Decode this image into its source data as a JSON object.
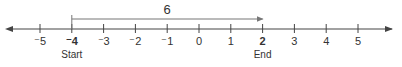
{
  "number_line": {
    "min": -5,
    "max": 5,
    "ticks": [
      {
        "value": -5,
        "label": "⁻5",
        "bold": false
      },
      {
        "value": -4,
        "label": "⁻4",
        "bold": true
      },
      {
        "value": -3,
        "label": "⁻3",
        "bold": false
      },
      {
        "value": -2,
        "label": "⁻2",
        "bold": false
      },
      {
        "value": -1,
        "label": "⁻1",
        "bold": false
      },
      {
        "value": 0,
        "label": "0",
        "bold": false
      },
      {
        "value": 1,
        "label": "1",
        "bold": false
      },
      {
        "value": 2,
        "label": "2",
        "bold": true
      },
      {
        "value": 3,
        "label": "3",
        "bold": false
      },
      {
        "value": 4,
        "label": "4",
        "bold": false
      },
      {
        "value": 5,
        "label": "5",
        "bold": false
      }
    ],
    "arrows_both_ends": true
  },
  "jump": {
    "from": -4,
    "to": 2,
    "label": "6",
    "start_label": "Start",
    "end_label": "End"
  },
  "colors": {
    "axis": "#444444",
    "jump_arrow": "#777777",
    "text": "#333333"
  }
}
